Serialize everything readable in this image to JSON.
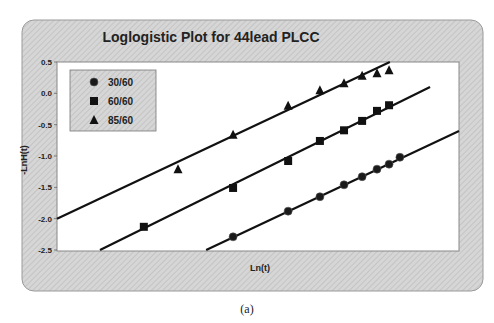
{
  "chart_data": {
    "type": "scatter",
    "title": "Loglogistic Plot for 44lead PLCC",
    "xlabel": "Ln(t)",
    "ylabel": "-LnH(t)",
    "ylim": [
      -2.5,
      0.5
    ],
    "yticks": [
      "0.5",
      "0.0",
      "-0.5",
      "-1.0",
      "-1.5",
      "-2.0",
      "-2.5"
    ],
    "ytick_values": [
      0.5,
      0.0,
      -0.5,
      -1.0,
      -1.5,
      -2.0,
      -2.5
    ],
    "xticks": [],
    "x_note": "x axis has no tick labels; x values are relative positions (0 = left edge, 1 = right edge of plot)",
    "xlim": [
      0,
      1
    ],
    "grid": false,
    "legend_position": "upper-left",
    "series": [
      {
        "name": "30/60",
        "marker": "circle",
        "x": [
          0.438,
          0.575,
          0.654,
          0.714,
          0.759,
          0.796,
          0.826,
          0.853
        ],
        "y": [
          -2.29,
          -1.88,
          -1.65,
          -1.46,
          -1.33,
          -1.21,
          -1.13,
          -1.02
        ],
        "fit_line": {
          "x": [
            0.371,
            1.0
          ],
          "y": [
            -2.5,
            -0.6
          ]
        }
      },
      {
        "name": "60/60",
        "marker": "square",
        "x": [
          0.216,
          0.438,
          0.575,
          0.654,
          0.714,
          0.759,
          0.796,
          0.826
        ],
        "y": [
          -2.13,
          -1.51,
          -1.08,
          -0.76,
          -0.59,
          -0.44,
          -0.28,
          -0.19
        ],
        "fit_line": {
          "x": [
            0.107,
            0.928
          ],
          "y": [
            -2.5,
            0.1
          ]
        }
      },
      {
        "name": "85/60",
        "marker": "triangle",
        "x": [
          0.301,
          0.438,
          0.575,
          0.654,
          0.714,
          0.759,
          0.796,
          0.826
        ],
        "y": [
          -1.21,
          -0.66,
          -0.2,
          0.05,
          0.16,
          0.28,
          0.32,
          0.37
        ],
        "fit_line": {
          "x": [
            0.0,
            0.828
          ],
          "y": [
            -2.0,
            0.5
          ]
        }
      }
    ]
  },
  "caption": "(a)"
}
